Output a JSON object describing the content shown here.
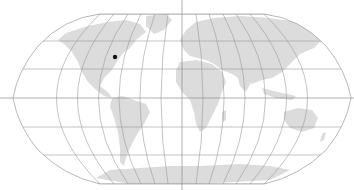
{
  "map": {
    "projection": "Robinson",
    "background_color": "#ffffff",
    "land_color": "#dcdcdc",
    "graticule_color": "#9a9a9a",
    "axis_color": "#8c8c8c",
    "graticule": {
      "meridian_step_deg": 30,
      "parallel_step_deg": 30
    },
    "markers": [
      {
        "name": "location-marker",
        "lon": -80,
        "lat": 38,
        "color": "#111111"
      }
    ]
  }
}
